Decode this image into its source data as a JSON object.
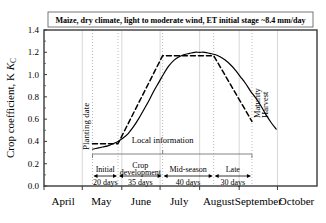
{
  "chart_data": {
    "type": "line",
    "title": "Maize, dry climate, light to moderate wind, ET initial stage ~8.4 mm/day",
    "xlabel": "",
    "ylabel": "Crop coefficient, K",
    "ylabel_sub": "C",
    "ylim": [
      0.0,
      1.4
    ],
    "yticks": [
      "0.0",
      "0.2",
      "0.4",
      "0.6",
      "0.8",
      "1.0",
      "1.2",
      "1.4"
    ],
    "ytick_values": [
      0.0,
      0.2,
      0.4,
      0.6,
      0.8,
      1.0,
      1.2,
      1.4
    ],
    "xlim_days": [
      0,
      214
    ],
    "xtick_labels": [
      "April",
      "May",
      "June",
      "July",
      "August",
      "September",
      "October"
    ],
    "xtick_month_starts": [
      0,
      30,
      61,
      91,
      122,
      153,
      183
    ],
    "xtick_month_mid": [
      15,
      45,
      76,
      106,
      137,
      168,
      198
    ],
    "grid": true,
    "legend": "none",
    "series": [
      {
        "name": "Actual Kc curve (smooth)",
        "style": "solid",
        "x": [
          38,
          42,
          46,
          50,
          54,
          58,
          62,
          66,
          70,
          74,
          78,
          82,
          86,
          90,
          94,
          98,
          102,
          106,
          110,
          114,
          118,
          122,
          126,
          130,
          134,
          138,
          142,
          146,
          150,
          154,
          158,
          162,
          166,
          170,
          174,
          178,
          182
        ],
        "y": [
          0.33,
          0.34,
          0.35,
          0.36,
          0.38,
          0.4,
          0.43,
          0.47,
          0.53,
          0.6,
          0.68,
          0.76,
          0.85,
          0.93,
          1.01,
          1.08,
          1.13,
          1.16,
          1.18,
          1.19,
          1.2,
          1.2,
          1.2,
          1.19,
          1.18,
          1.16,
          1.13,
          1.09,
          1.04,
          0.98,
          0.92,
          0.85,
          0.79,
          0.72,
          0.64,
          0.57,
          0.51
        ]
      },
      {
        "name": "FAO segmented Kc curve (dashed)",
        "style": "dashed",
        "x": [
          38,
          58,
          93,
          133,
          163
        ],
        "y": [
          0.38,
          0.38,
          1.17,
          1.17,
          0.58
        ]
      }
    ],
    "annotations": [
      {
        "name": "planting-date",
        "text": "Planting date",
        "x": 38,
        "orientation": "vertical"
      },
      {
        "name": "maturity",
        "text": "Maturity",
        "x": 163,
        "orientation": "vertical"
      },
      {
        "name": "harvest",
        "text": "Harvest",
        "x": 163,
        "orientation": "vertical"
      },
      {
        "name": "local-information",
        "text": "Local information",
        "x": 93,
        "y": 0.4
      }
    ],
    "stages": [
      {
        "label": "Initial",
        "days_label": "20 days",
        "days": 20,
        "start": 38,
        "end": 58
      },
      {
        "label": "Crop\ndevelopment",
        "days_label": "35 days",
        "days": 35,
        "start": 58,
        "end": 93
      },
      {
        "label": "Mid-season",
        "days_label": "40 days",
        "days": 40,
        "start": 93,
        "end": 133
      },
      {
        "label": "Late",
        "days_label": "30 days",
        "days": 30,
        "start": 133,
        "end": 163
      }
    ],
    "stage_labels": [
      "Initial",
      "Crop",
      "development",
      "Mid-season",
      "Late"
    ],
    "stage_day_labels": [
      "20 days",
      "35 days",
      "40 days",
      "30 days"
    ],
    "dotted_markers_days": [
      38,
      58,
      93,
      133,
      163
    ],
    "colors": {
      "curve": "#000000",
      "grid": "#d8d8d8",
      "dotted": "#b9b9b9",
      "axis": "#3a3a3a",
      "background": "#ffffff"
    }
  }
}
